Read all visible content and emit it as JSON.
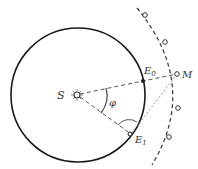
{
  "diagram": {
    "labels": {
      "sun": "S",
      "mars": "M",
      "earth0": "E",
      "earth0_sub": "0",
      "earth1": "E",
      "earth1_sub": "1",
      "angle": "φ"
    },
    "colors": {
      "line": "#1a1a1a",
      "dashed": "#555555",
      "background": "#ffffff"
    }
  }
}
